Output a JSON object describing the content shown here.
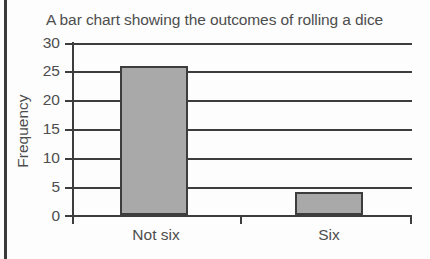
{
  "chart_data": {
    "type": "bar",
    "title": "A bar chart showing the outcomes of rolling a dice",
    "xlabel": "",
    "ylabel": "Frequency",
    "categories": [
      "Not six",
      "Six"
    ],
    "values": [
      26,
      4
    ],
    "series": [
      {
        "name": "Frequency",
        "values": [
          26,
          4
        ]
      }
    ],
    "ylim": [
      0,
      30
    ],
    "yticks": [
      0,
      5,
      10,
      15,
      20,
      25,
      30
    ],
    "ytick_labels": [
      "0",
      "5",
      "10",
      "15",
      "20",
      "25",
      "30"
    ],
    "grid": true,
    "grid_axis": "y",
    "legend": false,
    "legend_position": "none",
    "bar_fill_color": "#a9a9a9",
    "bar_edge_color": "#3d3d3d",
    "axis_color": "#3d3d3d",
    "text_color": "#4d4d4d",
    "background_color": "#fdfdfd"
  }
}
